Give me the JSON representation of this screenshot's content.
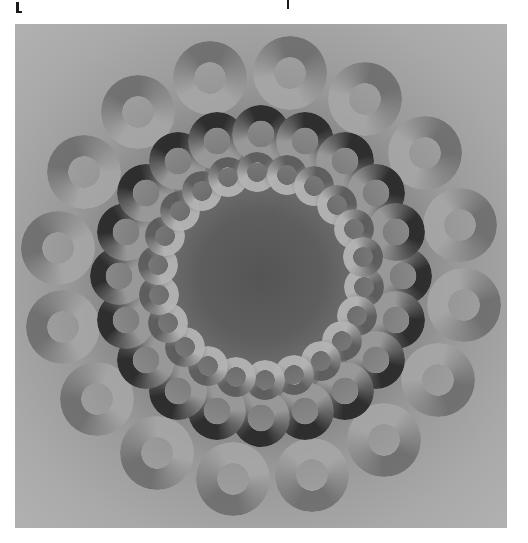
{
  "artwork": {
    "title": "",
    "description": "Concentric rings of shaded annuli on a gray radial-gradient panel",
    "panel": {
      "x": 15,
      "y": 24,
      "width": 492,
      "height": 504
    },
    "center": {
      "x": 246,
      "y": 252
    },
    "background_colors": {
      "center": "#555555",
      "mid": "#7a7a7a",
      "edge": "#b1b1b1"
    },
    "layers": [
      {
        "name": "outer",
        "count": 16,
        "orbit_radius": 205,
        "ring_diameter": 74,
        "hole_ratio": 0.42,
        "dark": "#6a6a6a",
        "light": "#a8a8a8",
        "phase_deg": 8,
        "opacity": 0.85
      },
      {
        "name": "middle",
        "count": 20,
        "orbit_radius": 142,
        "ring_diameter": 58,
        "hole_ratio": 0.45,
        "dark": "#2a2a2a",
        "light": "#9a9a9a",
        "phase_deg": 0,
        "opacity": 0.95
      },
      {
        "name": "inner",
        "count": 22,
        "orbit_radius": 104,
        "ring_diameter": 40,
        "hole_ratio": 0.48,
        "dark": "#5c5c5c",
        "light": "#b4b4b4",
        "phase_deg": 6,
        "opacity": 0.95
      }
    ]
  },
  "crop_marks": [
    {
      "glyph": "[",
      "x": 16,
      "y": 2,
      "w": 3,
      "h": 11
    },
    {
      "glyph": "|",
      "x": 287,
      "y": 0,
      "w": 2,
      "h": 9
    }
  ]
}
